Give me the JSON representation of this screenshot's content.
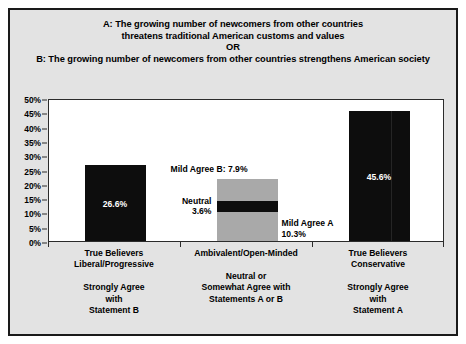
{
  "figure": {
    "background_color": "#e3e3e3",
    "border_color": "#1a1a1a",
    "plot_background_color": "#ffffff"
  },
  "title": {
    "line1": "A: The growing number of newcomers from other countries",
    "line2": "threatens traditional American customs and values",
    "line3": "OR",
    "line4": "B: The growing number of newcomers from other countries strengthens American society"
  },
  "chart_data": {
    "type": "bar",
    "xlabel": "",
    "ylabel": "",
    "ylim": [
      0,
      50
    ],
    "ytick_labels": [
      "0%",
      "5%",
      "10%",
      "15%",
      "20%",
      "25%",
      "30%",
      "35%",
      "40%",
      "45%",
      "50%"
    ],
    "ytick_values": [
      0,
      5,
      10,
      15,
      20,
      25,
      30,
      35,
      40,
      45,
      50
    ],
    "grid": false,
    "legend": "none",
    "stacked": true,
    "categories": [
      "True Believers Liberal/Progressive",
      "Ambivalent/Open-Minded",
      "True Believers Conservative"
    ],
    "bars": [
      {
        "category": "True Believers Liberal/Progressive",
        "total": 26.6,
        "segments": [
          {
            "name": "Strongly Agree with Statement B",
            "value": 26.6,
            "color": "#0d0d0d",
            "label": "26.6%",
            "label_position": "inside"
          }
        ]
      },
      {
        "category": "Ambivalent/Open-Minded",
        "total": 21.8,
        "segments": [
          {
            "name": "Mild Agree A",
            "value": 10.3,
            "color": "#a9a9a9",
            "label": "Mild Agree A 10.3%",
            "label_position": "outside-right"
          },
          {
            "name": "Neutral",
            "value": 3.6,
            "color": "#0d0d0d",
            "label": "Neutral 3.6%",
            "label_position": "outside-left"
          },
          {
            "name": "Mild Agree B",
            "value": 7.9,
            "color": "#a9a9a9",
            "label": "Mild Agree B: 7.9%",
            "label_position": "above"
          }
        ]
      },
      {
        "category": "True Believers Conservative",
        "total": 45.6,
        "segments": [
          {
            "name": "Strongly Agree with Statement A",
            "value": 45.6,
            "color": "#0d0d0d",
            "label": "45.6%",
            "label_position": "inside"
          }
        ]
      }
    ],
    "annotations": [
      {
        "text": "Mild Agree B: 7.9%",
        "value": 7.9
      },
      {
        "text": "Neutral",
        "value": 3.6
      },
      {
        "text": "3.6%",
        "value": 3.6
      },
      {
        "text": "Mild Agree A",
        "value": 10.3
      },
      {
        "text": "10.3%",
        "value": 10.3
      }
    ]
  },
  "bar_labels": {
    "bar1_value": "26.6%",
    "bar3_value": "45.6%",
    "mild_agree_b": "Mild Agree B: 7.9%",
    "neutral_name": "Neutral",
    "neutral_value": "3.6%",
    "mild_agree_a_name": "Mild Agree A",
    "mild_agree_a_value": "10.3%"
  },
  "x_categories": [
    {
      "group_top": [
        "True Believers",
        "Liberal/Progressive"
      ],
      "group_bottom": [
        "Strongly Agree",
        "with",
        "Statement B"
      ]
    },
    {
      "group_top": [
        "Ambivalent/Open-Minded"
      ],
      "group_bottom": [
        "Neutral or",
        "Somewhat Agree with",
        "Statements A or B"
      ]
    },
    {
      "group_top": [
        "True Believers",
        "Conservative"
      ],
      "group_bottom": [
        "Strongly Agree",
        "with",
        "Statement A"
      ]
    }
  ]
}
